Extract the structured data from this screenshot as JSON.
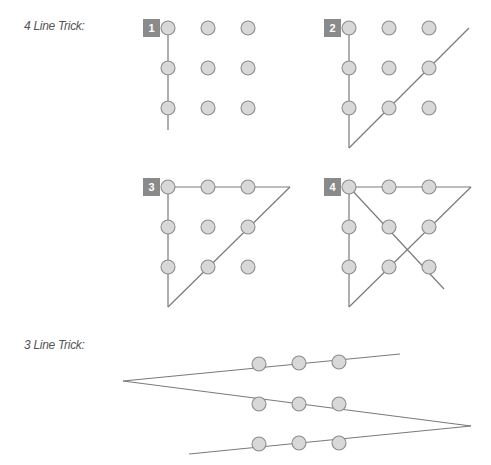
{
  "captions": {
    "four_line": "4 Line Trick:",
    "three_line": "3 Line Trick:"
  },
  "colors": {
    "dot_fill": "#d8d8d8",
    "dot_stroke": "#8c8c8c",
    "line": "#7a7a7a",
    "badge": "#8a8a8a",
    "caption": "#555555"
  },
  "panels": [
    {
      "step": "1",
      "origin": [
        168,
        28
      ]
    },
    {
      "step": "2",
      "origin": [
        349,
        28
      ]
    },
    {
      "step": "3",
      "origin": [
        168,
        187
      ]
    },
    {
      "step": "4",
      "origin": [
        349,
        187
      ]
    }
  ],
  "grid": {
    "rows": 3,
    "cols": 3,
    "spacing": 40,
    "dot_radius": 7
  },
  "lines": {
    "panel1": [
      [
        [
          168,
          28
        ],
        [
          168,
          130
        ]
      ]
    ],
    "panel2": [
      [
        [
          349,
          28
        ],
        [
          349,
          148
        ]
      ],
      [
        [
          349,
          148
        ],
        [
          469,
          28
        ]
      ]
    ],
    "panel3": [
      [
        [
          168,
          187
        ],
        [
          290,
          187
        ]
      ],
      [
        [
          168,
          187
        ],
        [
          168,
          307
        ]
      ],
      [
        [
          168,
          307
        ],
        [
          290,
          187
        ]
      ]
    ],
    "panel4": [
      [
        [
          349,
          187
        ],
        [
          471,
          187
        ]
      ],
      [
        [
          349,
          187
        ],
        [
          349,
          307
        ]
      ],
      [
        [
          349,
          307
        ],
        [
          471,
          187
        ]
      ],
      [
        [
          349,
          187
        ],
        [
          444,
          289
        ]
      ]
    ],
    "three_line": [
      [
        [
          400,
          354
        ],
        [
          123,
          381
        ]
      ],
      [
        [
          123,
          381
        ],
        [
          471,
          426
        ]
      ],
      [
        [
          471,
          426
        ],
        [
          189,
          454
        ]
      ]
    ]
  },
  "three_line_dots": {
    "x": [
      259,
      299,
      339
    ],
    "y": [
      [
        364,
        363,
        362
      ],
      [
        404,
        404,
        404
      ],
      [
        444,
        443,
        443
      ]
    ]
  }
}
